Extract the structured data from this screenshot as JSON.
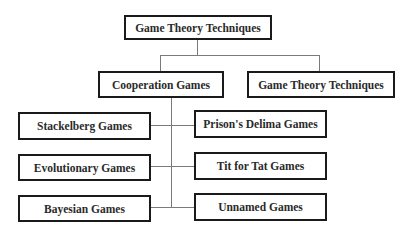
{
  "diagram": {
    "root": {
      "label": "Game Theory Techniques"
    },
    "level2": [
      {
        "label": "Cooperation Games"
      },
      {
        "label": "Game Theory Techniques"
      }
    ],
    "left_children": [
      {
        "label": "Stackelberg Games"
      },
      {
        "label": "Evolutionary Games"
      },
      {
        "label": "Bayesian Games"
      }
    ],
    "right_children": [
      {
        "label": "Prison's Delima Games"
      },
      {
        "label": "Tit for Tat Games"
      },
      {
        "label": "Unnamed Games"
      }
    ],
    "colors": {
      "box_border": "#1a1a1a",
      "connector": "#7a7a7a",
      "text": "#2a2a2a",
      "background": "#ffffff"
    }
  }
}
